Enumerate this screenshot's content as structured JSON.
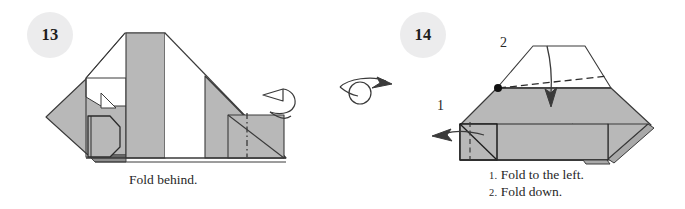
{
  "page": {
    "background_color": "#ffffff",
    "width": 685,
    "height": 209
  },
  "palette": {
    "paper_gray": "#b8b8b8",
    "paper_gray_dark": "#a9a9a9",
    "paper_white": "#ffffff",
    "ink": "#3a3a3a",
    "ink_strong": "#1d1d1d",
    "badge_fill": "#ececed",
    "text": "#272727"
  },
  "steps": [
    {
      "number": "13",
      "badge_name": "step-number-13",
      "caption": "Fold behind.",
      "caption_lines": [
        {
          "num": "",
          "text": "Fold behind."
        }
      ],
      "symbols": [
        {
          "name": "fold-behind-arrow",
          "label": "fold behind (mountain) wrap arrow"
        },
        {
          "name": "mountain-fold-line",
          "label": "dash-dot mountain fold line"
        }
      ]
    },
    {
      "number": "14",
      "badge_name": "step-number-14",
      "caption_lines": [
        {
          "num": "1.",
          "text": "Fold to the left."
        },
        {
          "num": "2.",
          "text": "Fold down."
        }
      ],
      "labels": [
        {
          "name": "fold-label-1",
          "text": "1"
        },
        {
          "name": "fold-label-2",
          "text": "2"
        }
      ],
      "symbols": [
        {
          "name": "turn-over-symbol",
          "label": "turn the model over"
        },
        {
          "name": "fold-left-arrow",
          "label": "fold to the left arrow"
        },
        {
          "name": "fold-down-arrow",
          "label": "fold down arrow"
        },
        {
          "name": "valley-fold-line-left",
          "label": "dashed valley fold line (left)"
        },
        {
          "name": "valley-fold-line-top",
          "label": "dashed valley fold line (top)"
        },
        {
          "name": "reference-point-dot",
          "label": "black reference point"
        }
      ]
    }
  ]
}
